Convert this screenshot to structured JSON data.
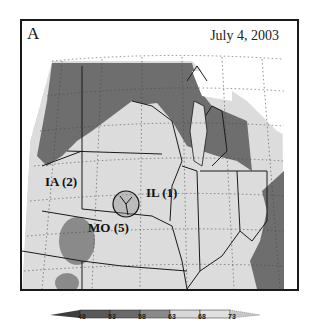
{
  "figure": {
    "panel_label": "A",
    "date": "July 4, 2003",
    "states": [
      {
        "label": "IA (2)"
      },
      {
        "label": "IL (1)"
      },
      {
        "label": "MO (5)"
      }
    ],
    "colorbar": {
      "ticks": [
        "48",
        "53",
        "58",
        "63",
        "68",
        "73"
      ],
      "colors": [
        "#3e3e3e",
        "#5a5a5a",
        "#777777",
        "#8f8f8f",
        "#d8d8d8",
        "#e2e2e2",
        "#c8c8c8"
      ]
    },
    "colors": {
      "dark_region": "#6a6a6a",
      "light_region": "#dcdcdc",
      "mid_region": "#8a8a8a",
      "outside": "#ffffff",
      "border": "#1a1a1a"
    }
  }
}
